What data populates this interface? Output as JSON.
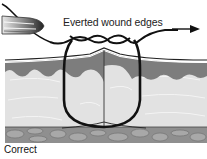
{
  "diagram": {
    "annotation": "Everted wound edges",
    "caption": "Correct",
    "colors": {
      "epidermis": "#7a7a7a",
      "dermis": "#dedede",
      "subcutaneous": "#8e8e8e",
      "suture": "#111111",
      "background": "#ffffff"
    },
    "elements": [
      "needle-holder",
      "suture-thread",
      "direction-arrow",
      "skin-layers",
      "wound-incision"
    ]
  }
}
